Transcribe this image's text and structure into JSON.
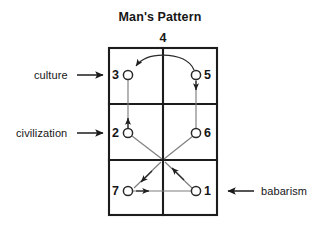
{
  "figure": {
    "title": "Man's Pattern",
    "top_number": "4",
    "background_color": "#ffffff",
    "line_color": "#1c1c1c",
    "flow_color": "#7e7e7e",
    "grid": {
      "columns": 2,
      "rows": 3
    },
    "nodes": [
      {
        "id": "node-3",
        "label": "3",
        "label_side": "left",
        "cx": 128,
        "cy": 75,
        "r": 4.6
      },
      {
        "id": "node-5",
        "label": "5",
        "label_side": "right",
        "cx": 196,
        "cy": 75,
        "r": 4.6
      },
      {
        "id": "node-2",
        "label": "2",
        "label_side": "left",
        "cx": 128,
        "cy": 133,
        "r": 4.6
      },
      {
        "id": "node-6",
        "label": "6",
        "label_side": "right",
        "cx": 196,
        "cy": 133,
        "r": 4.6
      },
      {
        "id": "node-7",
        "label": "7",
        "label_side": "left",
        "cx": 128,
        "cy": 191,
        "r": 4.6
      },
      {
        "id": "node-1",
        "label": "1",
        "label_side": "right",
        "cx": 196,
        "cy": 191,
        "r": 4.6
      }
    ],
    "side_labels": [
      {
        "id": "label-culture",
        "text": "culture",
        "arrow": "right",
        "row": "top"
      },
      {
        "id": "label-civilization",
        "text": "civilization",
        "arrow": "right",
        "row": "middle"
      },
      {
        "id": "label-babarism",
        "text": "babarism",
        "arrow": "left",
        "row": "bottom"
      }
    ],
    "flows": [
      {
        "id": "flow-1-to-center",
        "from": "1",
        "to": "center",
        "shape": "diagonal"
      },
      {
        "id": "flow-center-to-7",
        "from": "center",
        "to": "7",
        "shape": "diagonal"
      },
      {
        "id": "flow-7-to-1",
        "from": "7",
        "to": "1",
        "shape": "horizontal"
      },
      {
        "id": "flow-2-to-center",
        "from": "2",
        "to": "center",
        "shape": "diagonal"
      },
      {
        "id": "flow-center-to-6",
        "from": "center",
        "to": "6",
        "shape": "diagonal"
      },
      {
        "id": "flow-2-to-3",
        "from": "2",
        "to": "3",
        "shape": "vertical"
      },
      {
        "id": "flow-5-to-3",
        "from": "5",
        "to": "3",
        "shape": "arc"
      },
      {
        "id": "flow-5-to-6",
        "from": "5",
        "to": "6",
        "shape": "vertical"
      }
    ]
  }
}
